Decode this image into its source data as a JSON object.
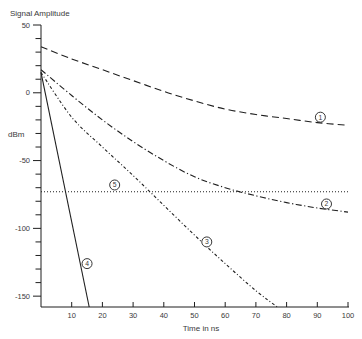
{
  "page": {
    "background": "#ffffff"
  },
  "chart_data": {
    "type": "line",
    "title": "Signal Amplitude",
    "ylabel": "dBm",
    "xlabel": "Time in ns",
    "xlim": [
      0,
      100
    ],
    "ylim": [
      -158,
      50
    ],
    "x_ticks": [
      10,
      20,
      30,
      40,
      50,
      60,
      70,
      80,
      90,
      100
    ],
    "y_major_ticks": [
      50,
      0,
      -50,
      -100,
      -150
    ],
    "y_minor_step": 10,
    "grid": false,
    "line_color": "#1f1f1f",
    "text_color": "#3a3a3a",
    "legend_note": "curves identified by circled numbers placed on the plot",
    "series": [
      {
        "label": "1",
        "style": "dashed",
        "points": [
          [
            0,
            34
          ],
          [
            10,
            25
          ],
          [
            20,
            17
          ],
          [
            30,
            9
          ],
          [
            40,
            1
          ],
          [
            50,
            -6
          ],
          [
            60,
            -12
          ],
          [
            70,
            -16
          ],
          [
            80,
            -19
          ],
          [
            90,
            -22
          ],
          [
            100,
            -24
          ]
        ],
        "label_at": [
          91,
          -18
        ]
      },
      {
        "label": "2",
        "style": "dashdot",
        "points": [
          [
            0,
            17
          ],
          [
            10,
            -2
          ],
          [
            20,
            -20
          ],
          [
            30,
            -36
          ],
          [
            40,
            -50
          ],
          [
            50,
            -62
          ],
          [
            60,
            -70
          ],
          [
            70,
            -76
          ],
          [
            80,
            -81
          ],
          [
            90,
            -85
          ],
          [
            100,
            -88
          ]
        ],
        "label_at": [
          93,
          -82
        ]
      },
      {
        "label": "3",
        "style": "dashdot-fine",
        "points": [
          [
            0,
            15
          ],
          [
            10,
            -18
          ],
          [
            20,
            -40
          ],
          [
            30,
            -61
          ],
          [
            40,
            -83
          ],
          [
            50,
            -105
          ],
          [
            60,
            -126
          ],
          [
            70,
            -146
          ],
          [
            77,
            -158
          ]
        ],
        "label_at": [
          54,
          -110
        ]
      },
      {
        "label": "4",
        "style": "solid",
        "points": [
          [
            0,
            15
          ],
          [
            15.7,
            -158
          ]
        ],
        "label_at": [
          15,
          -126
        ]
      },
      {
        "label": "5",
        "style": "dotted",
        "points": [
          [
            0,
            -73
          ],
          [
            100,
            -73
          ]
        ],
        "label_at": [
          24,
          -68
        ]
      }
    ]
  }
}
